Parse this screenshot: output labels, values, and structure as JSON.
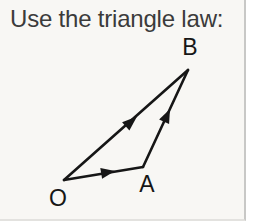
{
  "title": "Use the triangle law:",
  "diagram": {
    "vertex_labels": {
      "O": "O",
      "A": "A",
      "B": "B"
    },
    "arrows": [
      {
        "from": "O",
        "to": "A"
      },
      {
        "from": "A",
        "to": "B"
      },
      {
        "from": "O",
        "to": "B"
      }
    ]
  },
  "colors": {
    "card_background": "#f8f7f4",
    "line": "#161616",
    "title_text": "#3b3b3b",
    "right_border": "#c8c8c6"
  }
}
